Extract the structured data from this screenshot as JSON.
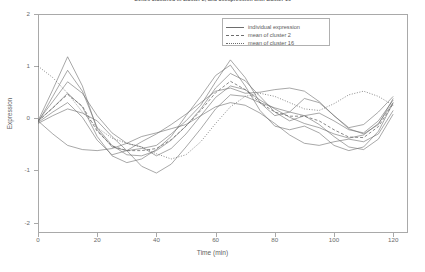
{
  "chart_data": {
    "type": "line",
    "title": "Genes clustered in cluster 2, and coexpression with cluster 16",
    "xlabel": "Time (min)",
    "ylabel": "Expression",
    "xlim": [
      0,
      125
    ],
    "ylim": [
      -2.2,
      2.0
    ],
    "xticks": [
      0,
      20,
      40,
      60,
      80,
      100,
      120
    ],
    "yticks": [
      2,
      1,
      0,
      -1,
      -2
    ],
    "xtick_labels": [
      "0",
      "20",
      "40",
      "60",
      "80",
      "100",
      "120"
    ],
    "ytick_labels": [
      "2",
      "1",
      "0",
      "-1",
      "-2"
    ],
    "grid": false,
    "legend_position": "top-right",
    "legend": [
      {
        "label": "individual expression",
        "style": "solid"
      },
      {
        "label": "mean of cluster 2",
        "style": "dashed"
      },
      {
        "label": "mean of cluster 16",
        "style": "dotted"
      }
    ],
    "x": [
      0,
      5,
      10,
      15,
      20,
      25,
      30,
      35,
      40,
      45,
      50,
      55,
      60,
      65,
      70,
      75,
      80,
      85,
      90,
      95,
      100,
      105,
      110,
      115,
      120
    ],
    "series": [
      {
        "name": "individual expression 1",
        "style": "solid",
        "values": [
          -0.05,
          0.55,
          1.18,
          0.62,
          -0.22,
          -0.55,
          -0.62,
          -0.58,
          -0.52,
          -0.3,
          -0.05,
          0.25,
          0.7,
          1.12,
          0.78,
          0.3,
          0.05,
          0.12,
          0.38,
          0.3,
          0.05,
          -0.18,
          -0.12,
          0.12,
          0.42
        ]
      },
      {
        "name": "individual expression 2",
        "style": "solid",
        "values": [
          -0.08,
          0.42,
          0.92,
          0.52,
          -0.18,
          -0.52,
          -0.7,
          -0.72,
          -0.62,
          -0.42,
          -0.15,
          0.18,
          0.58,
          0.86,
          0.72,
          0.42,
          0.12,
          -0.05,
          0.05,
          0.1,
          -0.05,
          -0.22,
          -0.28,
          -0.05,
          0.35
        ]
      },
      {
        "name": "individual expression 3",
        "style": "solid",
        "values": [
          -0.05,
          0.32,
          0.7,
          0.48,
          0.05,
          -0.28,
          -0.48,
          -0.55,
          -0.72,
          -0.58,
          -0.3,
          0.05,
          0.4,
          0.62,
          0.55,
          0.35,
          0.18,
          0.02,
          -0.1,
          -0.18,
          -0.3,
          -0.38,
          -0.32,
          -0.1,
          0.3
        ]
      },
      {
        "name": "individual expression 4",
        "style": "solid",
        "values": [
          -0.1,
          0.05,
          0.18,
          0.1,
          -0.05,
          -0.35,
          -0.62,
          -0.92,
          -1.05,
          -0.88,
          -0.55,
          -0.2,
          0.18,
          0.45,
          0.42,
          0.3,
          0.2,
          0.12,
          0.05,
          -0.12,
          -0.35,
          -0.55,
          -0.6,
          -0.4,
          0.08
        ]
      },
      {
        "name": "individual expression 5",
        "style": "solid",
        "values": [
          -0.05,
          -0.3,
          -0.52,
          -0.6,
          -0.62,
          -0.58,
          -0.48,
          -0.35,
          -0.28,
          -0.2,
          -0.12,
          0.05,
          0.22,
          0.3,
          0.25,
          0.1,
          -0.1,
          -0.32,
          -0.48,
          -0.52,
          -0.45,
          -0.4,
          -0.45,
          -0.3,
          0.15
        ]
      },
      {
        "name": "individual expression 6",
        "style": "solid",
        "values": [
          -0.05,
          0.2,
          0.48,
          0.22,
          -0.35,
          -0.72,
          -0.85,
          -0.78,
          -0.6,
          -0.35,
          0.05,
          0.42,
          0.82,
          1.02,
          0.62,
          0.15,
          -0.15,
          -0.22,
          -0.15,
          -0.28,
          -0.52,
          -0.62,
          -0.55,
          -0.25,
          0.3
        ]
      },
      {
        "name": "individual expression 7",
        "style": "solid",
        "values": [
          -0.08,
          0.12,
          0.3,
          0.02,
          -0.42,
          -0.7,
          -0.62,
          -0.45,
          -0.3,
          -0.12,
          0.08,
          0.3,
          0.52,
          0.58,
          0.48,
          0.5,
          0.55,
          0.58,
          0.52,
          0.32,
          0.05,
          -0.2,
          -0.3,
          -0.12,
          0.38
        ]
      },
      {
        "name": "mean of cluster 2",
        "style": "dashed",
        "values": [
          -0.06,
          0.2,
          0.46,
          0.23,
          -0.25,
          -0.53,
          -0.62,
          -0.62,
          -0.58,
          -0.41,
          -0.15,
          0.15,
          0.49,
          0.71,
          0.55,
          0.3,
          0.12,
          0.04,
          0.04,
          -0.05,
          -0.22,
          -0.36,
          -0.37,
          -0.16,
          0.28
        ]
      },
      {
        "name": "mean of cluster 16",
        "style": "dotted",
        "values": [
          1.0,
          0.78,
          0.48,
          0.12,
          -0.18,
          -0.38,
          -0.48,
          -0.55,
          -0.68,
          -0.78,
          -0.7,
          -0.45,
          -0.1,
          0.22,
          0.42,
          0.48,
          0.42,
          0.3,
          0.18,
          0.15,
          0.28,
          0.45,
          0.52,
          0.42,
          0.25
        ]
      }
    ]
  }
}
